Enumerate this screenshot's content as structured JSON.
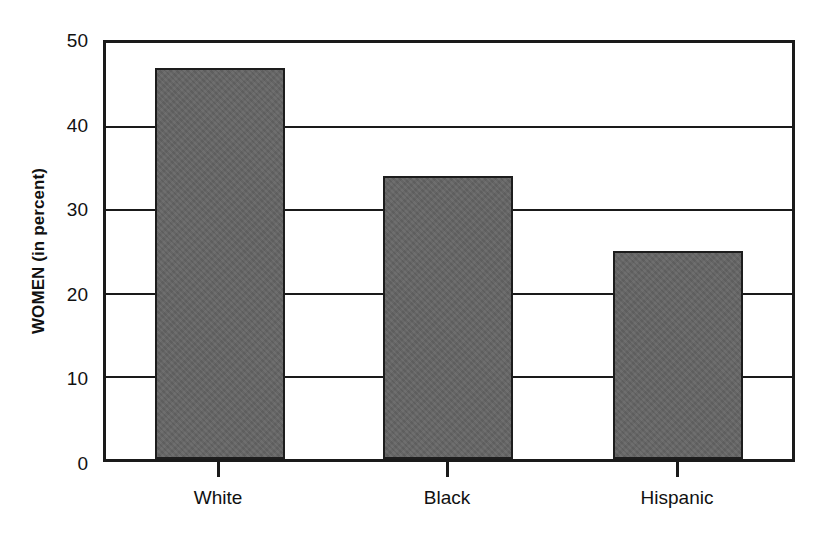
{
  "chart_data": {
    "type": "bar",
    "title": "",
    "subtitle": "",
    "xlabel": "",
    "ylabel": "WOMEN (in percent)",
    "categories": [
      "White",
      "Black",
      "Hispanic"
    ],
    "values": [
      47,
      34,
      25
    ],
    "series": [
      {
        "name": "WOMEN (in percent)",
        "values": [
          47,
          34,
          25
        ]
      }
    ],
    "ylim": [
      0,
      50
    ],
    "y_ticks": [
      0,
      10,
      20,
      30,
      40,
      50
    ],
    "y_tick_labels": [
      "0",
      "10",
      "20",
      "30",
      "40",
      "50"
    ],
    "grid": "horizontal",
    "gridlines_at": [
      10,
      20,
      30,
      40
    ],
    "legend": "none",
    "bar_color": "#636363",
    "bar_border_color": "#1d1d1d",
    "axis_color": "#1a1a1a",
    "background_color": "#ffffff",
    "annotations": []
  },
  "axes": {
    "y": {
      "title": "WOMEN (in percent)",
      "ticks": [
        {
          "label": "50",
          "value": 50
        },
        {
          "label": "40",
          "value": 40
        },
        {
          "label": "30",
          "value": 30
        },
        {
          "label": "20",
          "value": 20
        },
        {
          "label": "10",
          "value": 10
        },
        {
          "label": "0",
          "value": 0
        }
      ]
    },
    "x": {
      "title": "",
      "ticks": [
        {
          "label": "White"
        },
        {
          "label": "Black"
        },
        {
          "label": "Hispanic"
        }
      ]
    }
  },
  "bars": [
    {
      "category": "White",
      "value": 47
    },
    {
      "category": "Black",
      "value": 34
    },
    {
      "category": "Hispanic",
      "value": 25
    }
  ]
}
